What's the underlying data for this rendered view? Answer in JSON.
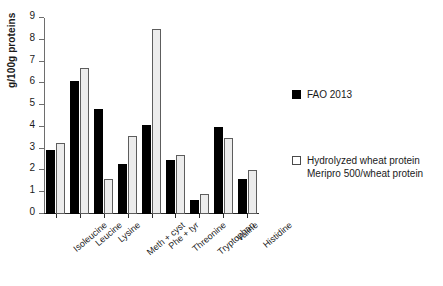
{
  "chart_data": {
    "type": "bar",
    "title": "",
    "xlabel": "",
    "ylabel": "g/100g proteins",
    "ylim": [
      0,
      9
    ],
    "ytick_step": 1,
    "yticks": [
      0,
      1,
      2,
      3,
      4,
      5,
      6,
      7,
      8,
      9
    ],
    "grid": false,
    "legend_position": "right",
    "categories": [
      "Isoleucine",
      "Leucine",
      "Lysine",
      "Meth + cyst",
      "Phe + tyr",
      "Threonine",
      "Tryptophan",
      "Valine",
      "Histidine"
    ],
    "series": [
      {
        "name": "FAO 2013",
        "color": "#000000",
        "style": "filled",
        "values": [
          2.95,
          6.1,
          4.8,
          2.3,
          4.1,
          2.5,
          0.65,
          4.0,
          1.6
        ]
      },
      {
        "name": "Hydrolyzed wheat protein Meripro 500/wheat protein",
        "color": "#ececec",
        "style": "open",
        "values": [
          3.25,
          6.7,
          1.6,
          3.6,
          8.5,
          2.7,
          0.9,
          3.5,
          2.0
        ]
      }
    ]
  },
  "legend": {
    "entries": [
      {
        "label_line1": "FAO 2013",
        "label_line2": ""
      },
      {
        "label_line1": "Hydrolyzed wheat protein",
        "label_line2": "Meripro 500/wheat protein"
      }
    ]
  },
  "colors": {
    "series_0": "#000000",
    "series_1": "#ececec",
    "axis": "#2b2b2b",
    "text": "#1a1a1a",
    "background": "#ffffff"
  }
}
